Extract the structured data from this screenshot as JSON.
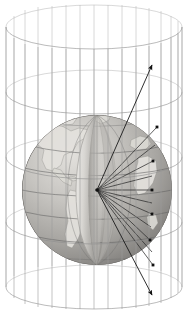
{
  "figure": {
    "background_color": "#ffffff",
    "canvas": {
      "width": 188,
      "height": 314
    }
  },
  "colors": {
    "wireframe": "#8d8d8d",
    "wireframe_back": "#b9b9b9",
    "ray": "#2c2c2c",
    "arrow": "#1a1a1a",
    "dot": "#101010",
    "graticule": "#5f5f5f",
    "ocean_light": "#bdbdbd",
    "ocean_dark": "#9a9a9a",
    "land": "#e3e1dd",
    "cutaway_light": "#e8e6e2",
    "cutaway_shadow": "#8e8c88"
  },
  "cylinder": {
    "label": "projection-cylinder",
    "center_x": 94,
    "top_ellipse": {
      "cy": 27,
      "rx": 88,
      "ry": 22
    },
    "bottom_ellipse": {
      "cy": 287,
      "rx": 88,
      "ry": 22
    },
    "ring_count": 5,
    "ring_cy_values": [
      27,
      92,
      157,
      222,
      287
    ],
    "meridian_count": 19,
    "meridian_stroke": "#8d8d8d"
  },
  "globe": {
    "label": "earth-globe",
    "cx": 97,
    "cy": 190,
    "r": 75,
    "tilt_deg": -12,
    "parallel_count": 7,
    "meridian_count": 6,
    "cutaway": {
      "label": "cut-away-wedge",
      "present": true,
      "description": "lens-shaped interior slice exposing the globe centre"
    },
    "continents_visible": [
      "North America",
      "South America",
      "Africa",
      "Europe"
    ]
  },
  "projection_center": {
    "label": "globe-centre-projection-point",
    "x": 97,
    "y": 190
  },
  "rays": {
    "label": "projection-rays",
    "count": 11,
    "description": "straight lines from the globe centre through the surface to the cylinder wall",
    "endpoints": [
      {
        "x": 152,
        "y": 63,
        "on_cylinder": true,
        "marker": "arrowhead"
      },
      {
        "x": 157,
        "y": 127,
        "on_cylinder": true,
        "marker": "dot"
      },
      {
        "x": 153,
        "y": 161,
        "on_cylinder": true,
        "marker": "dot"
      },
      {
        "x": 152,
        "y": 190,
        "on_cylinder": true,
        "marker": "dot"
      },
      {
        "x": 152,
        "y": 214,
        "on_cylinder": true,
        "marker": "dot"
      },
      {
        "x": 150,
        "y": 240,
        "on_cylinder": true,
        "marker": "dot"
      },
      {
        "x": 153,
        "y": 265,
        "on_cylinder": true,
        "marker": "dot"
      },
      {
        "x": 152,
        "y": 297,
        "on_cylinder": true,
        "marker": "arrowhead"
      }
    ]
  },
  "arrows": [
    {
      "label": "upper-projection-arrow",
      "from": {
        "x": 97,
        "y": 190
      },
      "to": {
        "x": 152,
        "y": 63
      },
      "head": "filled-triangle",
      "direction": "outward-upper-right"
    },
    {
      "label": "lower-projection-arrow",
      "from": {
        "x": 97,
        "y": 190
      },
      "to": {
        "x": 152,
        "y": 297
      },
      "head": "filled-triangle",
      "direction": "outward-lower-right"
    }
  ]
}
